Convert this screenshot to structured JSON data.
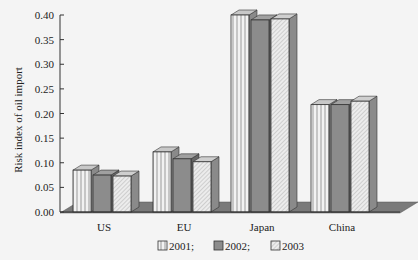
{
  "chart_data": {
    "type": "bar",
    "title": "",
    "xlabel": "",
    "ylabel": "Risk index of oil import",
    "ylim": [
      0,
      0.4
    ],
    "yticks": [
      "0.00",
      "0.05",
      "0.10",
      "0.15",
      "0.20",
      "0.25",
      "0.30",
      "0.35",
      "0.40"
    ],
    "categories": [
      "US",
      "EU",
      "Japan",
      "China"
    ],
    "series": [
      {
        "name": "2001",
        "legend_label": "2001;",
        "values": [
          0.085,
          0.122,
          0.4,
          0.218
        ],
        "pattern": "vertical-stripes",
        "color": "#e8e8e8"
      },
      {
        "name": "2002",
        "legend_label": "2002;",
        "values": [
          0.075,
          0.108,
          0.39,
          0.218
        ],
        "pattern": "solid-dark",
        "color": "#8c8c8c"
      },
      {
        "name": "2003",
        "legend_label": "2003",
        "values": [
          0.073,
          0.102,
          0.392,
          0.225
        ],
        "pattern": "diagonal-hatch",
        "color": "#dcdcdc"
      }
    ],
    "grid": false,
    "legend_position": "bottom",
    "style": "3d"
  }
}
